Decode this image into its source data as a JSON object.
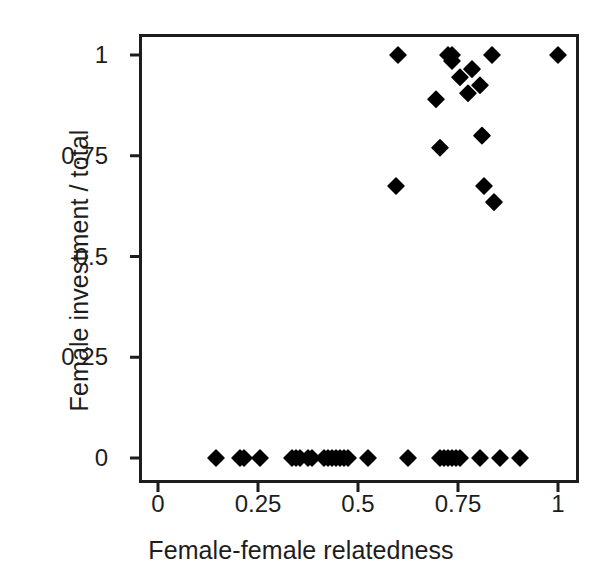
{
  "chart_data": {
    "type": "scatter",
    "title": "",
    "xlabel": "Female-female relatedness",
    "ylabel": "Female investment / total",
    "xlim": [
      -0.045,
      1.05
    ],
    "ylim": [
      -0.055,
      1.06
    ],
    "xticks": [
      0,
      0.25,
      0.5,
      0.75,
      1
    ],
    "xtick_labels": [
      "0",
      "0.25",
      "0.5",
      "0.75",
      "1"
    ],
    "yticks": [
      0,
      0.25,
      0.5,
      0.75,
      1
    ],
    "ytick_labels": [
      "0",
      "0.25",
      "0.5",
      "0.75",
      "1"
    ],
    "grid": false,
    "legend": null,
    "marker": "diamond",
    "marker_color": "#000000",
    "marker_size": 15,
    "frame": true,
    "points": [
      [
        0.145,
        0
      ],
      [
        0.205,
        0
      ],
      [
        0.215,
        0
      ],
      [
        0.255,
        0
      ],
      [
        0.335,
        0
      ],
      [
        0.345,
        0
      ],
      [
        0.355,
        0
      ],
      [
        0.375,
        0
      ],
      [
        0.385,
        0
      ],
      [
        0.415,
        0
      ],
      [
        0.425,
        0
      ],
      [
        0.435,
        0
      ],
      [
        0.445,
        0
      ],
      [
        0.455,
        0
      ],
      [
        0.465,
        0
      ],
      [
        0.475,
        0
      ],
      [
        0.525,
        0
      ],
      [
        0.625,
        0
      ],
      [
        0.705,
        0
      ],
      [
        0.715,
        0
      ],
      [
        0.725,
        0
      ],
      [
        0.735,
        0
      ],
      [
        0.745,
        0
      ],
      [
        0.755,
        0
      ],
      [
        0.805,
        0
      ],
      [
        0.855,
        0
      ],
      [
        0.905,
        0
      ],
      [
        0.595,
        0.675
      ],
      [
        0.6,
        1.0
      ],
      [
        0.695,
        0.89
      ],
      [
        0.705,
        0.77
      ],
      [
        0.725,
        1.0
      ],
      [
        0.735,
        1.0
      ],
      [
        0.735,
        0.985
      ],
      [
        0.755,
        0.945
      ],
      [
        0.775,
        0.905
      ],
      [
        0.785,
        0.965
      ],
      [
        0.805,
        0.925
      ],
      [
        0.81,
        0.8
      ],
      [
        0.815,
        0.675
      ],
      [
        0.835,
        1.0
      ],
      [
        0.84,
        0.635
      ],
      [
        1.0,
        1.0
      ]
    ]
  },
  "axes": {
    "x_title": "Female-female relatedness",
    "y_title": "Female investment / total"
  }
}
